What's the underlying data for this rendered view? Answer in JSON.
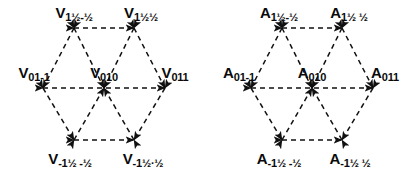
{
  "figure": {
    "background_color": "#ffffff",
    "stroke_color": "#111111",
    "text_color": "#0a0a0a",
    "dash_pattern": "5 4",
    "panels": [
      {
        "id": "voltage-hexagon",
        "symbol": "V",
        "nodes": [
          {
            "id": "v-top-left",
            "base": "V",
            "sub": "1½-½",
            "x": 74,
            "y": 28,
            "label_x": 74,
            "label_y": 14,
            "role": "vertex"
          },
          {
            "id": "v-top-right",
            "base": "V",
            "sub": "1½½",
            "x": 134,
            "y": 28,
            "label_x": 141,
            "label_y": 14,
            "role": "vertex"
          },
          {
            "id": "v-left",
            "base": "V",
            "sub": "01-1",
            "x": 43,
            "y": 88,
            "label_x": 34,
            "label_y": 74,
            "role": "vertex"
          },
          {
            "id": "v-center",
            "base": "V",
            "sub": "010",
            "x": 104,
            "y": 88,
            "label_x": 104,
            "label_y": 74,
            "role": "center"
          },
          {
            "id": "v-right",
            "base": "V",
            "sub": "011",
            "x": 165,
            "y": 88,
            "label_x": 175,
            "label_y": 74,
            "role": "vertex"
          },
          {
            "id": "v-bottom-left",
            "base": "V",
            "sub": "-1½ -½",
            "x": 74,
            "y": 140,
            "label_x": 70,
            "label_y": 160,
            "role": "vertex"
          },
          {
            "id": "v-bottom-right",
            "base": "V",
            "sub": "-1½·½",
            "x": 134,
            "y": 140,
            "label_x": 143,
            "label_y": 160,
            "role": "vertex"
          }
        ]
      },
      {
        "id": "current-hexagon",
        "symbol": "A",
        "nodes": [
          {
            "id": "a-top-left",
            "base": "A",
            "sub": "1½-½",
            "x": 74,
            "y": 28,
            "label_x": 71,
            "label_y": 14,
            "role": "vertex"
          },
          {
            "id": "a-top-right",
            "base": "A",
            "sub": "1½ ½",
            "x": 134,
            "y": 28,
            "label_x": 141,
            "label_y": 14,
            "role": "vertex"
          },
          {
            "id": "a-left",
            "base": "A",
            "sub": "01-1",
            "x": 43,
            "y": 88,
            "label_x": 31,
            "label_y": 74,
            "role": "vertex"
          },
          {
            "id": "a-center",
            "base": "A",
            "sub": "010",
            "x": 104,
            "y": 88,
            "label_x": 104,
            "label_y": 74,
            "role": "center"
          },
          {
            "id": "a-right",
            "base": "A",
            "sub": "011",
            "x": 165,
            "y": 88,
            "label_x": 177,
            "label_y": 74,
            "role": "vertex"
          },
          {
            "id": "a-bottom-left",
            "base": "A",
            "sub": "-1½ -½",
            "x": 74,
            "y": 140,
            "label_x": 71,
            "label_y": 160,
            "role": "vertex"
          },
          {
            "id": "a-bottom-right",
            "base": "A",
            "sub": "-1½ ½",
            "x": 134,
            "y": 140,
            "label_x": 142,
            "label_y": 160,
            "role": "vertex"
          }
        ]
      }
    ],
    "edges": [
      {
        "from": "top-left",
        "to": "top-right",
        "arrow": "both"
      },
      {
        "from": "top-left",
        "to": "left",
        "arrow": "both"
      },
      {
        "from": "top-right",
        "to": "right",
        "arrow": "both"
      },
      {
        "from": "left",
        "to": "bottom-left",
        "arrow": "both"
      },
      {
        "from": "right",
        "to": "bottom-right",
        "arrow": "both"
      },
      {
        "from": "bottom-left",
        "to": "bottom-right",
        "arrow": "both"
      },
      {
        "from": "left",
        "to": "right",
        "arrow": "both"
      },
      {
        "from": "top-left",
        "to": "center",
        "arrow": "both"
      },
      {
        "from": "top-right",
        "to": "center",
        "arrow": "both"
      },
      {
        "from": "bottom-left",
        "to": "center",
        "arrow": "both"
      },
      {
        "from": "bottom-right",
        "to": "center",
        "arrow": "both"
      }
    ]
  }
}
